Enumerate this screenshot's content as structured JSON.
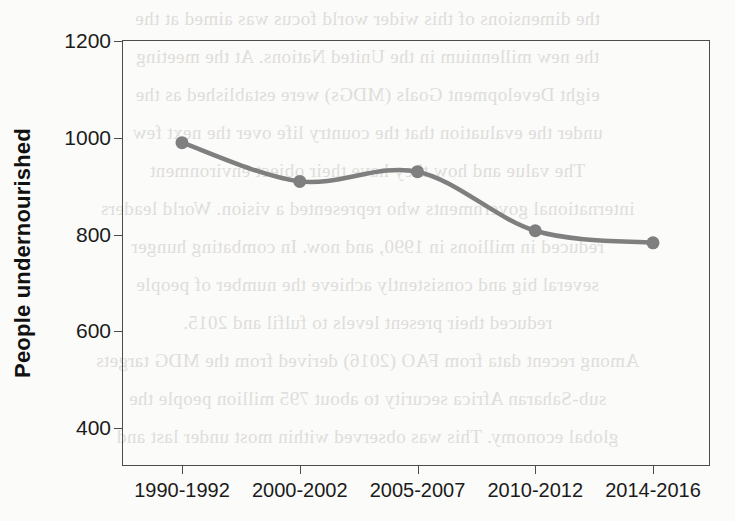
{
  "chart_data": {
    "type": "line",
    "title": "",
    "xlabel": "",
    "ylabel": "People undernourished",
    "categories": [
      "1990-1992",
      "2000-2002",
      "2005-2007",
      "2010-2012",
      "2014-2016"
    ],
    "values": [
      990,
      910,
      930,
      808,
      783
    ],
    "series": [
      {
        "name": "People undernourished",
        "values": [
          990,
          910,
          930,
          808,
          783
        ]
      }
    ],
    "ylim": [
      320,
      1200
    ],
    "yticks": [
      400,
      600,
      800,
      1000,
      1200
    ],
    "ytick_labels": [
      "400",
      "600",
      "800",
      "1000",
      "1200"
    ],
    "xtick_labels": [
      "1990-1992",
      "2000-2002",
      "2005-2007",
      "2010-2012",
      "2014-2016"
    ],
    "grid": false,
    "legend": "none",
    "line_color": "#7f7f7f",
    "marker": "circle",
    "marker_color": "#7f7f7f",
    "axis_color": "#4c4c4c",
    "background_color": "#fbfbfa",
    "units": "millions"
  },
  "background_bleed": {
    "note": "faint mirrored show-through text from the reverse side of the scanned page",
    "lines": [
      "the dimensions of this wider world focus was aimed at the",
      "the new millennium in the United Nations. At the meeting",
      "eight Development Goals (MDGs) were established as the",
      "under the evaluation that the country life over the next few",
      "The value and how they have their object environment",
      "international governments who represented a vision. World leaders",
      "reduced in millions in 1990, and now.      In combating hunger",
      "several big and consistently achieve the number of people",
      "reduced their present levels to fulfil and 2015.",
      "Among recent data from FAO (2016) derived from the MDG targets",
      "sub-Saharan Africa security to about 795 million people the",
      "global economy. This was observed within most under last and"
    ]
  }
}
